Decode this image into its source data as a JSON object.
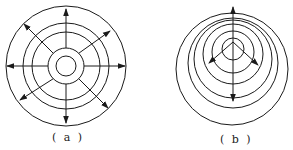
{
  "figures": [
    {
      "id": "a",
      "label": "( a )",
      "description": "Concentric circles with eight radial arrows pointing outward",
      "center": [
        66,
        66
      ],
      "circle_radii": [
        60,
        43,
        34,
        18,
        10
      ],
      "arrow_count": 8
    },
    {
      "id": "b",
      "label": "( b )",
      "description": "Eccentric nested circles offset upward with vertical double-headed arrow and two diagonal arrows",
      "circles": [
        {
          "cx": 232,
          "cy": 69,
          "r": 56
        },
        {
          "cx": 233,
          "cy": 63,
          "r": 45
        },
        {
          "cx": 233,
          "cy": 59,
          "r": 39
        },
        {
          "cx": 233,
          "cy": 54,
          "r": 30
        },
        {
          "cx": 233,
          "cy": 53,
          "r": 22
        },
        {
          "cx": 233,
          "cy": 49,
          "r": 11
        }
      ]
    }
  ],
  "colors": {
    "stroke": "#1a1a1a",
    "background": "#ffffff"
  }
}
